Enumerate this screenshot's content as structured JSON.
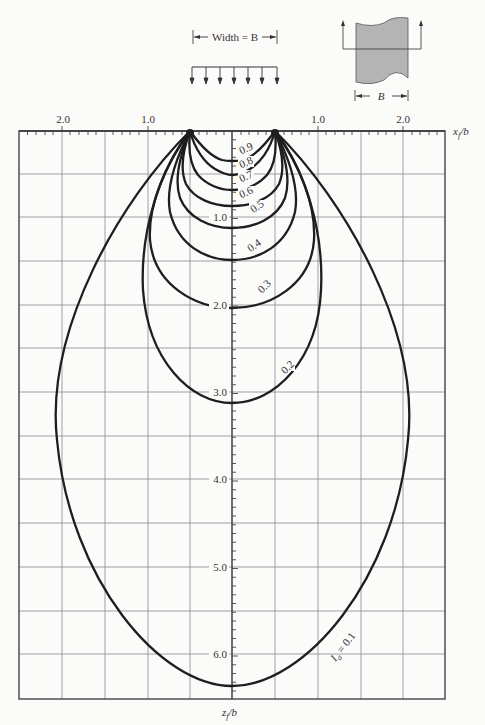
{
  "diagram": {
    "title_width_label": "Width = B",
    "section_label": "B",
    "x_axis_label": "x",
    "x_axis_sub": "f",
    "x_axis_den": "/b",
    "z_axis_label": "z",
    "z_axis_sub": "f",
    "z_axis_den": "/b",
    "x_ticks_left": [
      "2.0",
      "1.0"
    ],
    "x_ticks_right": [
      "1.0",
      "2.0"
    ],
    "z_ticks": [
      "1.0",
      "2.0",
      "3.0",
      "4.0",
      "5.0",
      "6.0"
    ],
    "isobar_labels": [
      "0.9",
      "0.8",
      "0.7",
      "0.6",
      "0.5",
      "0.4",
      "0.3",
      "0.2"
    ],
    "isobar_main_label_I": "I",
    "isobar_main_label_sub": "σ",
    "isobar_main_label_val": " = 0.1",
    "colors": {
      "curve": "#1e1e1e",
      "grid": "#8a8a8a",
      "footing_fill": "#b4b4b4"
    }
  },
  "chart_data": {
    "type": "line",
    "xlabel": "x_f/b",
    "ylabel": "z_f/b",
    "xlim": [
      -2.5,
      2.5
    ],
    "ylim": [
      6.6,
      0
    ],
    "grid": true,
    "x_ticks": [
      -2.0,
      -1.0,
      1.0,
      2.0
    ],
    "y_ticks": [
      1.0,
      2.0,
      3.0,
      4.0,
      5.0,
      6.0
    ],
    "footing_edges": [
      -0.5,
      0.5
    ],
    "series": [
      {
        "name": "I_σ = 0.9",
        "depth_on_centerline": 0.35,
        "max_half_width": 0.5
      },
      {
        "name": "I_σ = 0.8",
        "depth_on_centerline": 0.5,
        "max_half_width": 0.5
      },
      {
        "name": "I_σ = 0.7",
        "depth_on_centerline": 0.68,
        "max_half_width": 0.52
      },
      {
        "name": "I_σ = 0.6",
        "depth_on_centerline": 0.87,
        "max_half_width": 0.56
      },
      {
        "name": "I_σ = 0.5",
        "depth_on_centerline": 1.12,
        "max_half_width": 0.62
      },
      {
        "name": "I_σ = 0.4",
        "depth_on_centerline": 1.49,
        "max_half_width": 0.74
      },
      {
        "name": "I_σ = 0.3",
        "depth_on_centerline": 2.04,
        "max_half_width": 0.96
      },
      {
        "name": "I_σ = 0.2",
        "depth_on_centerline": 3.13,
        "max_half_width": 1.06
      },
      {
        "name": "I_σ = 0.1",
        "depth_on_centerline": 6.37,
        "max_half_width": 2.07
      }
    ]
  }
}
